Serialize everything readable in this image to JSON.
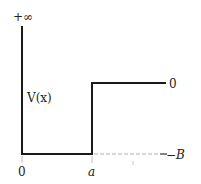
{
  "diagram": {
    "labels": {
      "top_left": "+∞",
      "function": "V(x)",
      "origin": "0",
      "step_position": "a",
      "right_high": "0",
      "right_low": "−B"
    },
    "geometry": {
      "infinite_wall_x": 0,
      "step_x": "a",
      "well_depth": "−B",
      "outside_value": "0"
    },
    "colors": {
      "line": "#1a1a1a",
      "dashed": "#b0b0b0",
      "text": "#222222"
    }
  }
}
